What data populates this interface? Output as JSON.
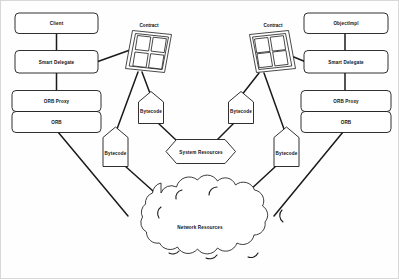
{
  "diagram": {
    "background_color": "#fefefe",
    "stroke_color": "#1a1a1a",
    "text_color": "#111111"
  },
  "left_stack": {
    "client": "Client",
    "smart_delegate": "Smart Delegate",
    "orb_proxy": "ORB Proxy",
    "orb": "ORB"
  },
  "right_stack": {
    "object_impl": "ObjectImpl",
    "smart_delegate": "Smart Delegate",
    "orb_proxy": "ORB Proxy",
    "orb": "ORB"
  },
  "contracts": [
    {
      "label": "Contract"
    },
    {
      "label": "Contract"
    }
  ],
  "bytecodes": [
    {
      "label": "Bytecode"
    },
    {
      "label": "Bytecode"
    },
    {
      "label": "Bytecode"
    },
    {
      "label": "Bytecode"
    }
  ],
  "system_resources": {
    "label": "System Resources"
  },
  "network_resources": {
    "label": "Network Resources"
  }
}
